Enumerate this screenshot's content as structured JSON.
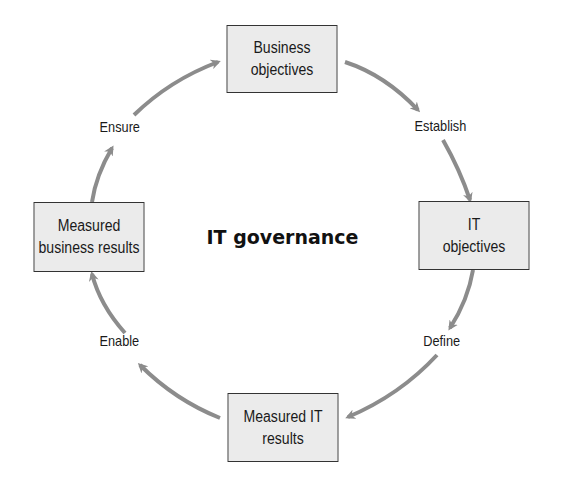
{
  "diagram": {
    "title": "IT governance",
    "nodes": [
      {
        "id": "business-objectives",
        "line1": "Business",
        "line2": "objectives"
      },
      {
        "id": "it-objectives",
        "line1": "IT",
        "line2": "objectives"
      },
      {
        "id": "measured-it-results",
        "line1": "Measured IT",
        "line2": "results"
      },
      {
        "id": "measured-business-results",
        "line1": "Measured",
        "line2": "business results"
      }
    ],
    "edges": [
      {
        "from": "business-objectives",
        "to": "it-objectives",
        "label": "Establish"
      },
      {
        "from": "it-objectives",
        "to": "measured-it-results",
        "label": "Define"
      },
      {
        "from": "measured-it-results",
        "to": "measured-business-results",
        "label": "Enable"
      },
      {
        "from": "measured-business-results",
        "to": "business-objectives",
        "label": "Ensure"
      }
    ],
    "colors": {
      "arrow": "#8c8c8c",
      "box_fill": "#ebebeb",
      "box_border": "#333333",
      "text": "#1a1a1a"
    }
  }
}
